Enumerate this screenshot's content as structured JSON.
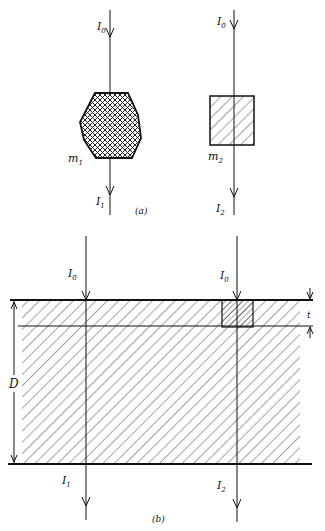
{
  "part_a": {
    "caption": "(a)",
    "beam1": {
      "incident": "I",
      "incident_sub": "0",
      "transmitted": "I",
      "transmitted_sub": "1"
    },
    "beam2": {
      "incident": "I",
      "incident_sub": "0",
      "transmitted": "I",
      "transmitted_sub": "2"
    },
    "sample1": {
      "label": "m",
      "label_sub": "1",
      "shape": "irregular",
      "hatch": "crosshatch"
    },
    "sample2": {
      "label": "m",
      "label_sub": "2",
      "shape": "square",
      "hatch": "diagonal"
    }
  },
  "part_b": {
    "caption": "(b)",
    "beam1": {
      "incident": "I",
      "incident_sub": "0",
      "transmitted": "I",
      "transmitted_sub": "1"
    },
    "beam2": {
      "incident": "I",
      "incident_sub": "0",
      "transmitted": "I",
      "transmitted_sub": "2"
    },
    "thickness_label": "D",
    "layer_label": "t"
  },
  "colors": {
    "ink": "#111111",
    "background": "#ffffff"
  }
}
